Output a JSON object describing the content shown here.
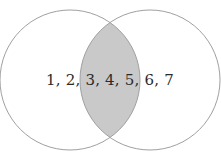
{
  "figure": {
    "type": "venn-diagram",
    "title": "",
    "background_color": "#ffffff",
    "width": 221,
    "height": 162
  },
  "diagram": {
    "stroke_color": "#a0a0a0",
    "stroke_width": 1,
    "circle_fill": "#ffffff",
    "intersection_fill": "#c9c9c9",
    "circles": [
      {
        "name": "left-circle",
        "cx": 70,
        "cy": 80,
        "r": 70
      },
      {
        "name": "right-circle",
        "cx": 150,
        "cy": 80,
        "r": 70
      }
    ],
    "intersection": {
      "name": "intersection-region",
      "shaded": true,
      "top_vertex": {
        "x": 110,
        "y": 23
      },
      "bottom_vertex": {
        "x": 110,
        "y": 138
      }
    }
  },
  "labels": {
    "elements_text": "1, 2, 3, 4, 5, 6, 7",
    "left_only": "1, 2,",
    "intersection_only": "3, 4, 5,",
    "right_only": "6, 7",
    "text_color": "#2b2b2b",
    "font_size": "15px",
    "center": {
      "x": 110,
      "y": 81
    }
  },
  "chart_data": {
    "type": "venn",
    "title": "",
    "sets": [
      {
        "name": "left-set",
        "label": "",
        "elements": [
          1,
          2,
          3,
          4,
          5
        ]
      },
      {
        "name": "right-set",
        "label": "",
        "elements": [
          3,
          4,
          5,
          6,
          7
        ]
      }
    ],
    "regions": [
      {
        "name": "left-only",
        "elements": [
          1,
          2
        ],
        "text": "1, 2,",
        "shaded": false
      },
      {
        "name": "intersection",
        "elements": [
          3,
          4,
          5
        ],
        "text": "3, 4, 5,",
        "shaded": true
      },
      {
        "name": "right-only",
        "elements": [
          6,
          7
        ],
        "text": "6, 7",
        "shaded": false
      }
    ],
    "all_elements": [
      1,
      2,
      3,
      4,
      5,
      6,
      7
    ],
    "legend": [],
    "grid": false
  }
}
